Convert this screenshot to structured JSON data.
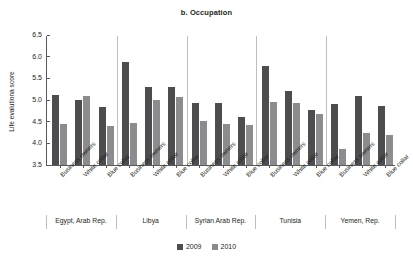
{
  "chart_data": {
    "type": "bar",
    "title": "b. Occupation",
    "xlabel": "",
    "ylabel": "Life evalutiona score",
    "ylim": [
      3.5,
      6.5
    ],
    "yticks": [
      "6.5",
      "6.0",
      "5.5",
      "5.0",
      "4.5",
      "4.0",
      "3.5"
    ],
    "grid": false,
    "legend_position": "bottom-center",
    "legend": [
      "2009",
      "2010"
    ],
    "colors": {
      "2009": "#4d4d4f",
      "2010": "#8c8c8e",
      "axis": "#58595b",
      "text": "#231f20"
    },
    "categories": [
      "Business owners",
      "White collar",
      "Blue collar",
      "Business owners",
      "White collar",
      "Blue collar",
      "Business owners",
      "White collar",
      "Blue collar",
      "Business owners",
      "White collar",
      "Blue collar",
      "Business owners",
      "White collar",
      "Blue collar"
    ],
    "groups": [
      {
        "name": "Egypt, Arab Rep.",
        "categories": [
          "Business owners",
          "White collar",
          "Blue collar"
        ],
        "values_2009": [
          5.12,
          5.0,
          4.83
        ],
        "values_2010": [
          4.44,
          5.1,
          4.4
        ]
      },
      {
        "name": "Libya",
        "categories": [
          "Business owners",
          "White collar",
          "Blue collar"
        ],
        "values_2009": [
          5.87,
          5.31,
          5.3
        ],
        "values_2010": [
          4.47,
          5.0,
          5.08
        ]
      },
      {
        "name": "Syrian Arab Rep.",
        "categories": [
          "Business owners",
          "White collar",
          "Blue collar"
        ],
        "values_2009": [
          4.93,
          4.93,
          4.6
        ],
        "values_2010": [
          4.52,
          4.45,
          4.42
        ]
      },
      {
        "name": "Tunisia",
        "categories": [
          "Business owners",
          "White collar",
          "Blue collar"
        ],
        "values_2009": [
          5.79,
          5.21,
          4.78
        ],
        "values_2010": [
          4.95,
          4.94,
          4.67
        ]
      },
      {
        "name": "Yemen, Rep.",
        "categories": [
          "Business owners",
          "White collar",
          "Blue collar"
        ],
        "values_2009": [
          4.91,
          5.09,
          4.86
        ],
        "values_2010": [
          3.87,
          4.25,
          4.19
        ]
      }
    ],
    "series": [
      {
        "name": "2009",
        "color": "#4d4d4f",
        "values": [
          5.12,
          5.0,
          4.83,
          5.87,
          5.31,
          5.3,
          4.93,
          4.93,
          4.6,
          5.79,
          5.21,
          4.78,
          4.91,
          5.09,
          4.86
        ]
      },
      {
        "name": "2010",
        "color": "#8c8c8e",
        "values": [
          4.44,
          5.1,
          4.4,
          4.47,
          5.0,
          5.08,
          4.52,
          4.45,
          4.42,
          4.95,
          4.94,
          4.67,
          3.87,
          4.25,
          4.19
        ]
      }
    ]
  }
}
